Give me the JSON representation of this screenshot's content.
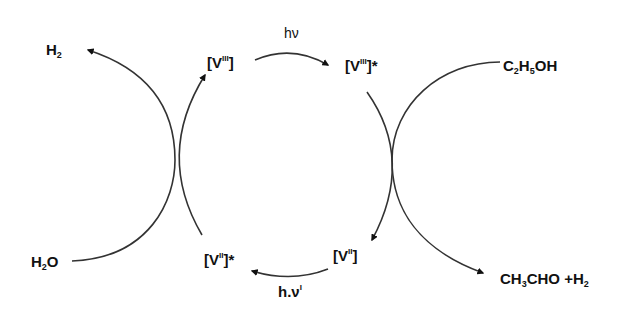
{
  "diagram": {
    "type": "photocatalytic cycle",
    "colors": {
      "stroke": "#333333",
      "text": "#111111",
      "background": "#ffffff"
    },
    "nodes": {
      "v3": {
        "base": "[V",
        "sup": "III",
        "close": "]",
        "star": ""
      },
      "v3_excited": {
        "base": "[V",
        "sup": "III",
        "close": "]",
        "star": "*"
      },
      "v2": {
        "base": "[V",
        "sup": "II",
        "close": "]",
        "star": ""
      },
      "v2_excited": {
        "base": "[V",
        "sup": "II",
        "close": "]",
        "star": "*"
      }
    },
    "species": {
      "h2_top": {
        "main": "H",
        "sub": "2"
      },
      "h2o": {
        "pre": "H",
        "sub": "2",
        "post": "O"
      },
      "ethanol": {
        "p1": "C",
        "s1": "2",
        "p2": "H",
        "s2": "5",
        "p3": "OH"
      },
      "products": {
        "p1": "CH",
        "s1": "3",
        "p2": "CHO +H",
        "s2": "2"
      }
    },
    "light": {
      "top": "hν",
      "bottom_main": "h.ν",
      "bottom_sup": "I"
    },
    "edges": [
      {
        "from": "[V(III)]",
        "to": "[V(III)]*",
        "label": "hν"
      },
      {
        "from": "[V(III)]*",
        "to": "[V(II)]",
        "coupled": "C2H5OH → CH3CHO + H2"
      },
      {
        "from": "[V(II)]",
        "to": "[V(II)]*",
        "label": "h.ν'"
      },
      {
        "from": "[V(II)]*",
        "to": "[V(III)]",
        "coupled": "H2O → H2"
      }
    ]
  }
}
